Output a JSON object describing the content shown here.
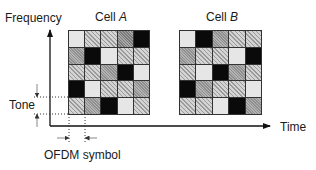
{
  "diagram": {
    "axis_labels": {
      "y": "Frequency",
      "x": "Time"
    },
    "cells": [
      {
        "label_prefix": "Cell ",
        "label_italic": "A",
        "rows": [
          [
            "light",
            "hatched",
            "hatched",
            "darkhatch",
            "black"
          ],
          [
            "medium",
            "black",
            "light",
            "hatched",
            "hatched"
          ],
          [
            "hatched",
            "hatched",
            "medium",
            "black",
            "light"
          ],
          [
            "black",
            "light",
            "hatched",
            "hatched",
            "medium"
          ],
          [
            "hatched",
            "medium",
            "black",
            "light",
            "hatched"
          ]
        ]
      },
      {
        "label_prefix": "Cell ",
        "label_italic": "B",
        "rows": [
          [
            "light",
            "black",
            "medium",
            "hatched",
            "hatched"
          ],
          [
            "medium",
            "hatched",
            "hatched",
            "light",
            "black"
          ],
          [
            "hatched",
            "light",
            "black",
            "medium",
            "hatched"
          ],
          [
            "black",
            "medium",
            "hatched",
            "hatched",
            "light"
          ],
          [
            "hatched",
            "hatched",
            "light",
            "black",
            "medium"
          ]
        ]
      }
    ],
    "annotations": {
      "tone": "Tone",
      "ofdm_symbol": "OFDM symbol"
    }
  }
}
